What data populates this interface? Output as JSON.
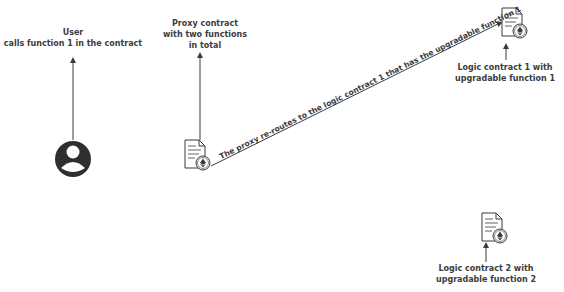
{
  "diagram": {
    "user": {
      "title": "User",
      "subtitle": "calls function 1 in the contract"
    },
    "proxy": {
      "line1": "Proxy contract",
      "line2": "with two functions",
      "line3": "in total"
    },
    "reroute_label": "The proxy re-routes to the logic contract 1 that has the upgradable function 1",
    "logic1": {
      "line1": "Logic contract 1 with",
      "line2": "upgradable function 1"
    },
    "logic2": {
      "line1": "Logic contract 2 with",
      "line2": "upgradable function 2"
    },
    "icons": {
      "user": "user-avatar-icon",
      "contract": "smart-contract-document-icon"
    },
    "colors": {
      "stroke": "#3a3a3a",
      "background": "#ffffff"
    }
  }
}
